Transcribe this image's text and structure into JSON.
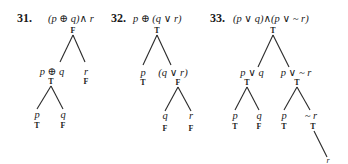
{
  "problems": [
    {
      "number": "31.",
      "formula": "(p ⊕ q)∧ r",
      "root_value": "F",
      "children": [
        {
          "label": "p ⊕ q",
          "value": "T",
          "children": [
            {
              "label": "p",
              "value": "T"
            },
            {
              "label": "q",
              "value": "F"
            }
          ]
        },
        {
          "label": "r",
          "value": "F"
        }
      ]
    },
    {
      "number": "32.",
      "formula": "p ⊕ (q ∨ r)",
      "root_value": "T",
      "children": [
        {
          "label": "p",
          "value": "T"
        },
        {
          "label": "(q ∨ r)",
          "value": "F",
          "children": [
            {
              "label": "q",
              "value": "F"
            },
            {
              "label": "r",
              "value": "F"
            }
          ]
        }
      ]
    },
    {
      "number": "33.",
      "formula": "(p ∨ q)∧(p ∨ ~ r)",
      "root_value": "T",
      "children": [
        {
          "label": "p ∨ q",
          "value": "T",
          "children": [
            {
              "label": "p",
              "value": "T"
            },
            {
              "label": "q",
              "value": "F"
            }
          ]
        },
        {
          "label": "p ∨ ~ r",
          "value": "T",
          "children": [
            {
              "label": "p",
              "value": "T"
            },
            {
              "label": "~ r",
              "value": "T",
              "children": [
                {
                  "label": "r",
                  "value": ""
                }
              ]
            }
          ]
        }
      ]
    }
  ]
}
